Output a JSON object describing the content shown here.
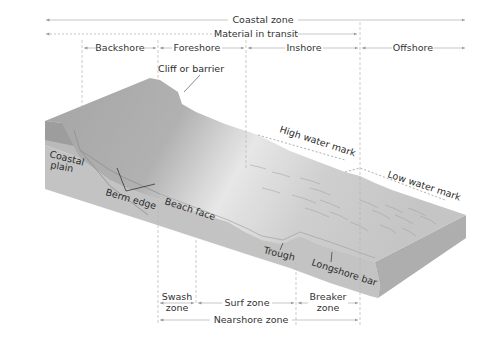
{
  "diagram": {
    "top_spans": {
      "coastal_zone": "Coastal zone",
      "material_in_transit": "Material in transit"
    },
    "zones": [
      {
        "label": "Backshore"
      },
      {
        "label": "Foreshore"
      },
      {
        "label": "Inshore"
      },
      {
        "label": "Offshore"
      }
    ],
    "features": {
      "cliff": "Cliff or barrier",
      "high_water": "High water mark",
      "low_water": "Low water mark",
      "coastal_plain_1": "Coastal",
      "coastal_plain_2": "plain",
      "berm_edge": "Berm edge",
      "beach_face": "Beach face",
      "trough": "Trough",
      "longshore_bar": "Longshore bar"
    },
    "bottom_spans": {
      "swash_1": "Swash",
      "swash_2": "zone",
      "surf": "Surf zone",
      "breaker_1": "Breaker",
      "breaker_2": "zone",
      "nearshore": "Nearshore zone"
    },
    "colors": {
      "top_surface_dark": "#a9a9a9",
      "top_surface_light": "#e6e6e6",
      "front_face": "#c4c4c4",
      "right_face": "#b3b3b3",
      "coastal_plain_band": "#9c9c9c",
      "guide_line": "#b8b8b8",
      "text": "#2b2b2b"
    }
  }
}
